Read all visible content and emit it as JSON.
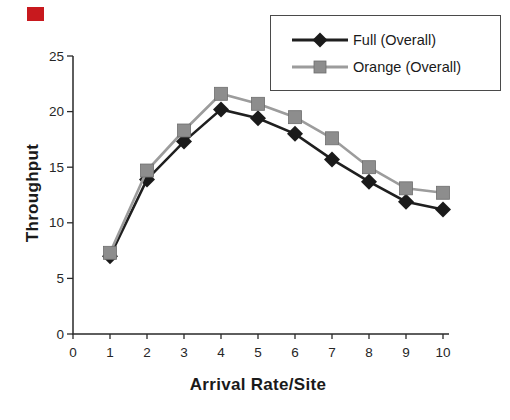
{
  "chart_data": {
    "type": "line",
    "title": "",
    "xlabel": "Arrival Rate/Site",
    "ylabel": "Throughput",
    "x": [
      1,
      2,
      3,
      4,
      5,
      6,
      7,
      8,
      9,
      10
    ],
    "xticks": [
      0,
      1,
      2,
      3,
      4,
      5,
      6,
      7,
      8,
      9,
      10
    ],
    "yticks": [
      0,
      5,
      10,
      15,
      20,
      25
    ],
    "xlim": [
      0,
      10
    ],
    "ylim": [
      0,
      25
    ],
    "grid": false,
    "legend_position": "top-right",
    "series": [
      {
        "name": "Full (Overall)",
        "marker": "diamond",
        "color": "#1f1f1f",
        "marker_color": "#1a1a1a",
        "values": [
          7.0,
          13.9,
          17.3,
          20.2,
          19.4,
          18.0,
          15.7,
          13.7,
          11.9,
          11.2
        ]
      },
      {
        "name": "Orange (Overall)",
        "marker": "square",
        "color": "#9c9c9c",
        "marker_color": "#8d8d8d",
        "values": [
          7.3,
          14.7,
          18.3,
          21.6,
          20.7,
          19.5,
          17.6,
          15.0,
          13.1,
          12.7
        ]
      }
    ]
  },
  "decorations": {
    "red_square_color": "#c8191e",
    "axis_color": "#2a2a2a"
  }
}
